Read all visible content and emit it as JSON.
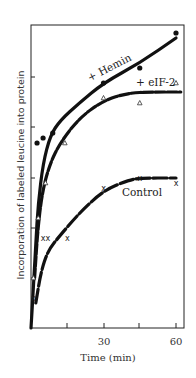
{
  "chart_data": {
    "type": "line",
    "title": "",
    "xlabel": "Time (min)",
    "ylabel": "Incorporation of labeled leucine into protein",
    "xlim": [
      0,
      63
    ],
    "ylim": [
      0,
      6
    ],
    "xticks": [
      15,
      30,
      45,
      60
    ],
    "xtick_labels": [
      "",
      "30",
      "",
      "60"
    ],
    "yticks": [
      1,
      2,
      3,
      4,
      5
    ],
    "ytick_labels": [
      "",
      "",
      "",
      "",
      ""
    ],
    "grid": false,
    "legend": "inline labels",
    "series": [
      {
        "name": "+ Hemin",
        "marker": "filled-circle",
        "points": [
          [
            2.5,
            3.7
          ],
          [
            5,
            3.8
          ],
          [
            9,
            3.9
          ],
          [
            30,
            4.9
          ],
          [
            45,
            5.2
          ],
          [
            60,
            5.9
          ]
        ],
        "curve": [
          [
            0,
            0
          ],
          [
            1,
            0.8
          ],
          [
            2,
            1.7
          ],
          [
            3,
            2.5
          ],
          [
            5,
            3.3
          ],
          [
            8,
            3.85
          ],
          [
            12,
            4.15
          ],
          [
            20,
            4.5
          ],
          [
            30,
            4.9
          ],
          [
            45,
            5.3
          ],
          [
            60,
            5.8
          ]
        ]
      },
      {
        "name": "+ eIF-2",
        "marker": "open-triangle",
        "points": [
          [
            1,
            1.0
          ],
          [
            3,
            2.2
          ],
          [
            6,
            2.9
          ],
          [
            14,
            3.7
          ],
          [
            30,
            4.6
          ],
          [
            45,
            4.5
          ],
          [
            60,
            4.9
          ]
        ],
        "curve": [
          [
            1.5,
            1.0
          ],
          [
            3,
            2.1
          ],
          [
            5,
            2.8
          ],
          [
            8,
            3.3
          ],
          [
            12,
            3.7
          ],
          [
            20,
            4.2
          ],
          [
            30,
            4.55
          ],
          [
            40,
            4.7
          ],
          [
            50,
            4.72
          ],
          [
            62,
            4.72
          ]
        ]
      },
      {
        "name": "Control",
        "marker": "x",
        "points": [
          [
            1,
            0.6
          ],
          [
            5,
            1.8
          ],
          [
            7,
            1.8
          ],
          [
            15,
            1.8
          ],
          [
            30,
            2.8
          ],
          [
            45,
            3.0
          ],
          [
            60,
            2.9
          ]
        ],
        "curve": [
          [
            2,
            0.5
          ],
          [
            4,
            1.1
          ],
          [
            7,
            1.55
          ],
          [
            12,
            1.85
          ],
          [
            20,
            2.3
          ],
          [
            30,
            2.75
          ],
          [
            40,
            2.95
          ],
          [
            45,
            3.0
          ],
          [
            60,
            3.0
          ]
        ]
      }
    ],
    "annotations": [
      "+ Hemin",
      "+ eIF-2",
      "Control"
    ]
  },
  "labels": {
    "xlabel": "Time (min)",
    "ylabel": "Incorporation of labeled leucine into protein",
    "xtick_30": "30",
    "xtick_60": "60",
    "hemin": "+ Hemin",
    "eif2": "+ eIF-2",
    "control": "Control"
  }
}
